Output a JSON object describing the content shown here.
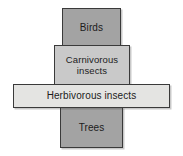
{
  "diagram": {
    "type": "trophic-pyramid",
    "title": "",
    "background_color": "#ffffff",
    "tiers": [
      {
        "id": "birds",
        "label": "Birds",
        "level": 4,
        "fill_color": "#a3a3a3",
        "border_color": "#3a3a3a",
        "text_color": "#1c1c1c",
        "width_px": 59,
        "height_px": 39
      },
      {
        "id": "carnivorous-insects",
        "label": "Carnivorous insects",
        "level": 3,
        "fill_color": "#c9c9c9",
        "border_color": "#3a3a3a",
        "text_color": "#1c1c1c",
        "width_px": 76,
        "height_px": 41
      },
      {
        "id": "herbivorous-insects",
        "label": "Herbivorous insects",
        "level": 2,
        "fill_color": "#e4e4e2",
        "border_color": "#3a3a3a",
        "text_color": "#1c1c1c",
        "width_px": 157,
        "height_px": 24
      },
      {
        "id": "trees",
        "label": "Trees",
        "level": 1,
        "fill_color": "#a3a3a3",
        "border_color": "#3a3a3a",
        "text_color": "#1c1c1c",
        "width_px": 63,
        "height_px": 41
      }
    ]
  }
}
